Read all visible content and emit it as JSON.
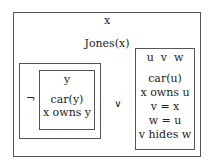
{
  "diagram": {
    "type": "existential-graph",
    "outer": {
      "variables": "x",
      "conditions": [
        "Jones(x)"
      ]
    },
    "negation": {
      "symbol": "¬",
      "inner": {
        "variables": "y",
        "conditions": [
          "car(y)",
          "x owns y"
        ]
      }
    },
    "disjunction_symbol": "∨",
    "right": {
      "variables": "u  v  w",
      "conditions": [
        "car(u)",
        "x owns u",
        "v = x",
        "w = u",
        "v hides w"
      ]
    }
  }
}
